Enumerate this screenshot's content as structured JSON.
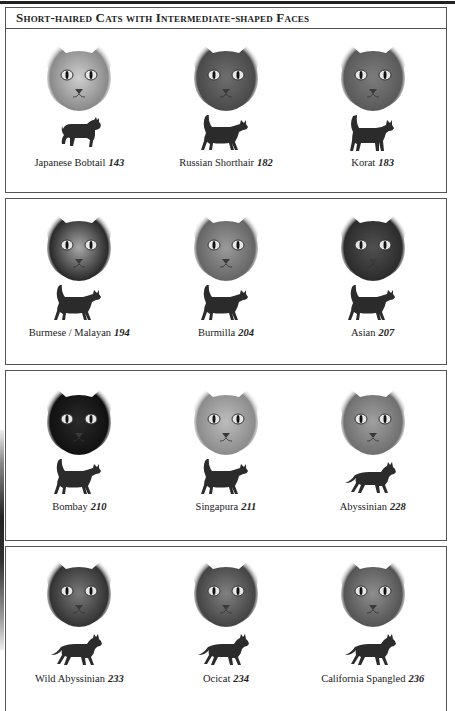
{
  "page": {
    "title": "Short-haired Cats with Intermediate-shaped Faces"
  },
  "colors": {
    "border": "#555555",
    "silhouette": "#2b2b2b",
    "text": "#222222"
  },
  "rows": [
    {
      "cats": [
        {
          "name": "Japanese Bobtail",
          "page": "143",
          "face_tone": "#cfcfcf",
          "face_dark": "#8a8a8a",
          "silhouette": "bobtail-silhouette-icon"
        },
        {
          "name": "Russian Shorthair",
          "page": "182",
          "face_tone": "#6e6e6e",
          "face_dark": "#4a4a4a",
          "silhouette": "walking-cat-tail-up-icon"
        },
        {
          "name": "Korat",
          "page": "183",
          "face_tone": "#7c7c7c",
          "face_dark": "#5a5a5a",
          "silhouette": "standing-cat-tail-up-icon"
        }
      ]
    },
    {
      "cats": [
        {
          "name": "Burmese / Malayan",
          "page": "194",
          "face_tone": "#a8a8a8",
          "face_dark": "#2a2a2a",
          "silhouette": "walking-cat-tail-up-icon"
        },
        {
          "name": "Burmilla",
          "page": "204",
          "face_tone": "#9a9a9a",
          "face_dark": "#666666",
          "silhouette": "walking-cat-tail-up-icon"
        },
        {
          "name": "Asian",
          "page": "207",
          "face_tone": "#505050",
          "face_dark": "#2c2c2c",
          "silhouette": "walking-cat-tail-up-icon"
        }
      ]
    },
    {
      "cats": [
        {
          "name": "Bombay",
          "page": "210",
          "face_tone": "#2a2a2a",
          "face_dark": "#111111",
          "silhouette": "walking-cat-tail-up-icon"
        },
        {
          "name": "Singapura",
          "page": "211",
          "face_tone": "#bdbdbd",
          "face_dark": "#8c8c8c",
          "silhouette": "walking-cat-tail-up-icon"
        },
        {
          "name": "Abyssinian",
          "page": "228",
          "face_tone": "#a0a0a0",
          "face_dark": "#707070",
          "silhouette": "walking-cat-tail-down-icon"
        }
      ]
    },
    {
      "cats": [
        {
          "name": "Wild Abyssinian",
          "page": "233",
          "face_tone": "#7a7a7a",
          "face_dark": "#333333",
          "silhouette": "walking-cat-tail-down-icon"
        },
        {
          "name": "Ocicat",
          "page": "234",
          "face_tone": "#808080",
          "face_dark": "#444444",
          "silhouette": "walking-cat-tail-down-icon"
        },
        {
          "name": "California Spangled",
          "page": "236",
          "face_tone": "#8e8e8e",
          "face_dark": "#555555",
          "silhouette": "walking-cat-tail-down-icon"
        }
      ]
    }
  ]
}
